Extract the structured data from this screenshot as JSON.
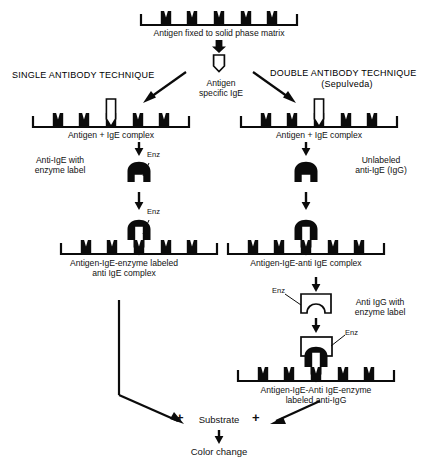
{
  "diagram": {
    "title_left": "SINGLE ANTIBODY TECHNIQUE",
    "title_right": "DOUBLE ANTIBODY TECHNIQUE",
    "title_right_sub": "(Sepulveda)",
    "top_caption": "Antigen fixed to solid phase matrix",
    "split_label_line1": "Antigen",
    "split_label_line2": "specific IgE",
    "left": {
      "complex1_caption": "Antigen + IgE complex",
      "reagent_label_line1": "Anti-IgE with",
      "reagent_label_line2": "enzyme label",
      "enzyme_tag_1": "Enz",
      "enzyme_tag_2": "Enz",
      "complex2_caption_line1": "Antigen-IgE-enzyme labeled",
      "complex2_caption_line2": "anti IgE complex"
    },
    "right": {
      "complex1_caption": "Antigen + IgE complex",
      "reagent_label_line1": "Unlabeled",
      "reagent_label_line2": "anti-IgE (IgG)",
      "complex2_caption": "Antigen-IgE-anti IgE complex",
      "reagent2_label_line1": "Anti IgG with",
      "reagent2_label_line2": "enzyme label",
      "enzyme_tag_1": "Enz",
      "enzyme_tag_2": "Enz",
      "complex3_caption_line1": "Antigen-IgE-Anti IgE-enzyme",
      "complex3_caption_line2": "labeled anti-IgG"
    },
    "footer": {
      "plus_left": "+",
      "substrate": "Substrate",
      "plus_right": "+",
      "result": "Color change"
    },
    "colors": {
      "ink": "#0b0b0b",
      "paper": "#ffffff"
    }
  }
}
